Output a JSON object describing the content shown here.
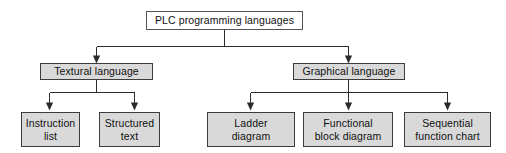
{
  "diagram": {
    "type": "tree",
    "colors": {
      "root_fill": "#ffffff",
      "node_fill": "#d9d9d9",
      "border": "#3c3c3c",
      "line": "#2b2b2b",
      "text": "#101010",
      "background": "#ffffff"
    },
    "root": {
      "label": "PLC programming languages"
    },
    "branches": [
      {
        "label": "Textural language",
        "children": [
          {
            "label": "Instruction\nlist"
          },
          {
            "label": "Structured\ntext"
          }
        ]
      },
      {
        "label": "Graphical language",
        "children": [
          {
            "label": "Ladder\ndiagram"
          },
          {
            "label": "Functional\nblock diagram"
          },
          {
            "label": "Sequential\nfunction chart"
          }
        ]
      }
    ]
  }
}
